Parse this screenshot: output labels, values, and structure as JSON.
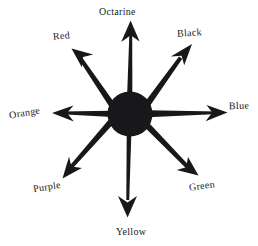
{
  "diagram": {
    "title": "",
    "type": "radial-arrow-starburst",
    "background_color": "#ffffff",
    "ink_color": "#18181a",
    "hub": {
      "name": "center-hub",
      "shape": "filled-circle",
      "center_x": 130,
      "center_y": 114,
      "radius": 22,
      "color": "#18181a"
    },
    "arrows": [
      {
        "id": "octarine",
        "label": "Octarine",
        "direction": "up",
        "angle_deg": 90
      },
      {
        "id": "black",
        "label": "Black",
        "direction": "up-right",
        "angle_deg": 45
      },
      {
        "id": "blue",
        "label": "Blue",
        "direction": "right",
        "angle_deg": 0
      },
      {
        "id": "green",
        "label": "Green",
        "direction": "down-right",
        "angle_deg": -45
      },
      {
        "id": "yellow",
        "label": "Yellow",
        "direction": "down",
        "angle_deg": -90
      },
      {
        "id": "purple",
        "label": "Purple",
        "direction": "down-left",
        "angle_deg": -135
      },
      {
        "id": "orange",
        "label": "Orange",
        "direction": "left",
        "angle_deg": 180
      },
      {
        "id": "red",
        "label": "Red",
        "direction": "up-left",
        "angle_deg": 135
      }
    ]
  }
}
